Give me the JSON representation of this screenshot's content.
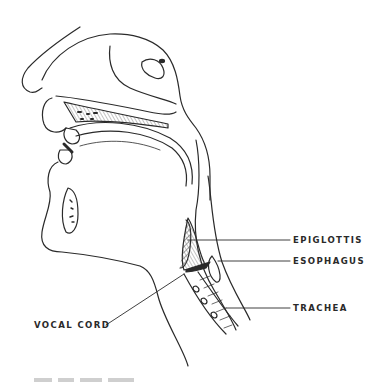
{
  "figure": {
    "labels": [
      {
        "id": "epiglottis",
        "text": "EPIGLOTTIS"
      },
      {
        "id": "esophagus",
        "text": "ESOPHAGUS"
      },
      {
        "id": "trachea",
        "text": "TRACHEA"
      },
      {
        "id": "vocal-cord",
        "text": "VOCAL CORD"
      }
    ],
    "caption": "Figure (partially cut off, illegible)"
  },
  "colors": {
    "ink": "#2a2a2a",
    "background": "#ffffff"
  }
}
